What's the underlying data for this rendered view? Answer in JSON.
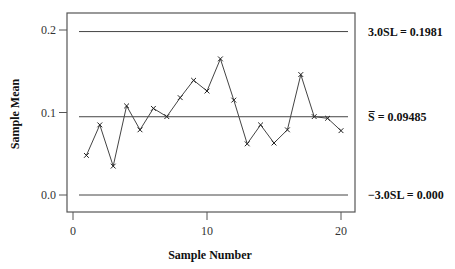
{
  "chart_data": {
    "type": "line",
    "title": "",
    "xlabel": "Sample Number",
    "ylabel": "Sample Mean",
    "xlim": [
      0,
      21
    ],
    "ylim": [
      -0.02,
      0.22
    ],
    "xticks": [
      0,
      10,
      20
    ],
    "xtick_labels": [
      "0",
      "10",
      "20"
    ],
    "yticks": [
      0.0,
      0.1,
      0.2
    ],
    "ytick_labels": [
      "0.0",
      "0.1",
      "0.2"
    ],
    "grid": false,
    "marker": "x",
    "x": [
      1,
      2,
      3,
      4,
      5,
      6,
      7,
      8,
      9,
      10,
      11,
      12,
      13,
      14,
      15,
      16,
      17,
      18,
      19,
      20
    ],
    "series": [
      {
        "name": "Sample Mean",
        "values": [
          0.048,
          0.085,
          0.035,
          0.108,
          0.079,
          0.105,
          0.095,
          0.118,
          0.139,
          0.126,
          0.165,
          0.115,
          0.062,
          0.085,
          0.063,
          0.079,
          0.146,
          0.095,
          0.093,
          0.078
        ]
      }
    ],
    "reference_lines": [
      {
        "name": "UCL",
        "value": 0.1981,
        "label": "3.0SL = 0.1981"
      },
      {
        "name": "Center",
        "value": 0.09485,
        "label": "S̅ = 0.09485"
      },
      {
        "name": "LCL",
        "value": 0.0,
        "label": "−3.0SL = 0.000"
      }
    ]
  },
  "labels": {
    "xlabel": "Sample Number",
    "ylabel": "Sample Mean",
    "ucl": "3.0SL = 0.1981",
    "center": "S̅ = 0.09485",
    "lcl": "−3.0SL = 0.000"
  }
}
